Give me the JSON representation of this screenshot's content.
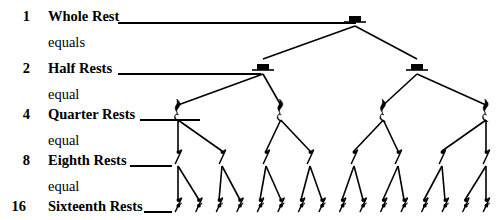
{
  "rows": [
    {
      "count": "1",
      "name": "Whole Rest",
      "connector": "equals",
      "rest_type": "whole",
      "nodes": 1
    },
    {
      "count": "2",
      "name": "Half Rests",
      "connector": "equal",
      "rest_type": "half",
      "nodes": 2
    },
    {
      "count": "4",
      "name": "Quarter Rests",
      "connector": "equal",
      "rest_type": "quarter",
      "nodes": 4
    },
    {
      "count": "8",
      "name": "Eighth Rests",
      "connector": "equal",
      "rest_type": "eighth",
      "nodes": 8
    },
    {
      "count": "16",
      "name": "Sixteenth Rests",
      "connector": "",
      "rest_type": "sixteenth",
      "nodes": 16
    }
  ],
  "colors": {
    "ink": "#000000",
    "background": "#ffffff"
  },
  "chart_data": {
    "type": "diagram",
    "levels": [
      {
        "level": 0,
        "count": 1,
        "label": "Whole Rest",
        "value": 1.0
      },
      {
        "level": 1,
        "count": 2,
        "label": "Half Rests",
        "value": 0.5
      },
      {
        "level": 2,
        "count": 4,
        "label": "Quarter Rests",
        "value": 0.25
      },
      {
        "level": 3,
        "count": 8,
        "label": "Eighth Rests",
        "value": 0.125
      },
      {
        "level": 4,
        "count": 16,
        "label": "Sixteenth Rests",
        "value": 0.0625
      }
    ],
    "branching_factor": 2
  }
}
